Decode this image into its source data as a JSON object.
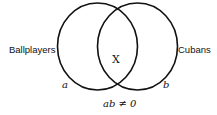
{
  "diagram": {
    "type": "venn",
    "sets": [
      {
        "name": "Ballplayers",
        "variable": "a"
      },
      {
        "name": "Cubans",
        "variable": "b"
      }
    ],
    "intersection_mark": "X",
    "equation": "ab ≠ 0",
    "colors": {
      "stroke": "#111111",
      "text": "#111111",
      "background": "#ffffff"
    }
  }
}
